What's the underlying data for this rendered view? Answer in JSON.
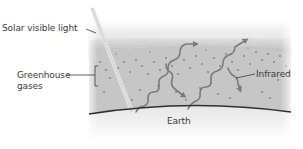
{
  "diagram": {
    "labels": {
      "solar": "Solar visible light",
      "greenhouse_line1": "Greenhouse",
      "greenhouse_line2": "gases",
      "infrared": "Infrared",
      "earth": "Earth"
    },
    "colors": {
      "atmosphere": "#c4c4c4",
      "arrow": "#7a7a7a",
      "earth_line": "#2f2f2f",
      "text": "#3a3a3a",
      "dots": "#5a5a5a"
    },
    "elements": [
      {
        "name": "solar-visible-light-beam",
        "description": "diagonal light ray entering atmosphere"
      },
      {
        "name": "greenhouse-gas-layer",
        "description": "dotted gray atmospheric band"
      },
      {
        "name": "infrared-arrows",
        "description": "wavy arrows; two escape upward, two reflected back to Earth"
      },
      {
        "name": "earth-surface",
        "description": "curved line representing Earth"
      }
    ]
  }
}
